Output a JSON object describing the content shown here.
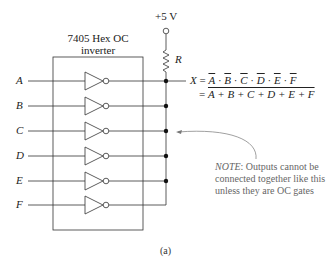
{
  "chip": {
    "title_line1": "7405 Hex OC",
    "title_line2": "inverter"
  },
  "supply": {
    "label": "+5 V",
    "resistor_label": "R"
  },
  "inputs": [
    "A",
    "B",
    "C",
    "D",
    "E",
    "F"
  ],
  "equation": {
    "lhs": "X",
    "line1_terms": [
      "A",
      "B",
      "C",
      "D",
      "E",
      "F"
    ],
    "line1_operator": "·",
    "line2_text": "A + B + C + D + E + F"
  },
  "note": {
    "prefix": "NOTE",
    "text": ": Outputs cannot be connected together like this unless they are OC gates"
  },
  "caption": "(a)",
  "colors": {
    "line": "#333333",
    "note_text": "#666666",
    "arrow": "#777777"
  }
}
